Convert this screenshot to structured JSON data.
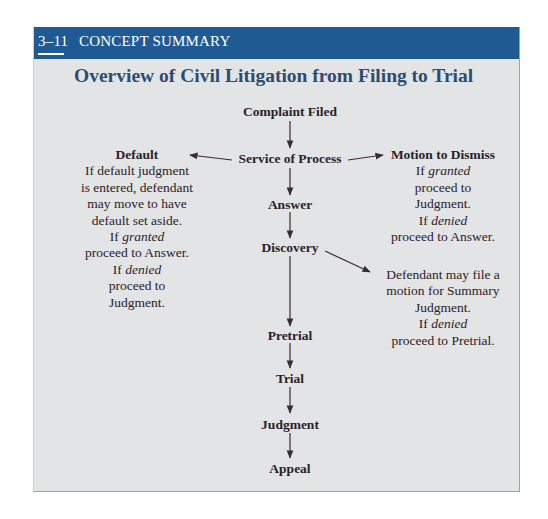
{
  "header": {
    "section_number": "3–11",
    "section_label": "CONCEPT SUMMARY",
    "band_color": "#1f5a92"
  },
  "title": "Overview of Civil Litigation from Filing to Trial",
  "nodes": {
    "complaint_filed": "Complaint Filed",
    "service_of_process": "Service of Process",
    "answer": "Answer",
    "discovery": "Discovery",
    "pretrial": "Pretrial",
    "trial": "Trial",
    "judgment": "Judgment",
    "appeal": "Appeal"
  },
  "branches": {
    "default": {
      "heading": "Default",
      "lines": [
        "If default judgment",
        "is entered, defendant",
        "may move to have",
        "default set aside."
      ],
      "granted_prefix": "If ",
      "granted_word": "granted",
      "granted_result": "proceed to Answer.",
      "denied_prefix": "If ",
      "denied_word": "denied",
      "denied_result_1": "proceed to",
      "denied_result_2": "Judgment."
    },
    "motion_to_dismiss": {
      "heading": "Motion to Dismiss",
      "granted_prefix": "If ",
      "granted_word": "granted",
      "granted_result_1": "proceed to",
      "granted_result_2": "Judgment.",
      "denied_prefix": "If ",
      "denied_word": "denied",
      "denied_result": "proceed to Answer."
    },
    "summary_judgment": {
      "lines": [
        "Defendant may file a",
        "motion for Summary",
        "Judgment."
      ],
      "denied_prefix": "If ",
      "denied_word": "denied",
      "denied_result": "proceed to Pretrial."
    }
  },
  "colors": {
    "panel_bg": "#e3e4e6",
    "title": "#2b4d73",
    "text": "#2b2226",
    "arrow": "#3a2c33"
  }
}
